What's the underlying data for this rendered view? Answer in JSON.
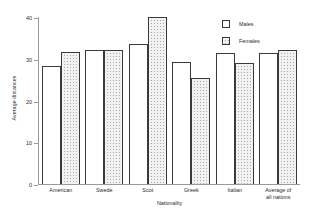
{
  "chart_data": {
    "type": "bar",
    "title": "",
    "xlabel": "Nationality",
    "ylabel": "Average distances",
    "ylim": [
      0,
      40
    ],
    "yticks": [
      0,
      10,
      20,
      30,
      40
    ],
    "grid": false,
    "legend_position": "top-right",
    "categories": [
      "American",
      "Swede",
      "Scot",
      "Greek",
      "Italian",
      "Average of\nall nations"
    ],
    "series": [
      {
        "name": "Males",
        "values": [
          28.2,
          32.2,
          33.6,
          29.2,
          31.5,
          31.3
        ]
      },
      {
        "name": "Females",
        "values": [
          31.6,
          32.2,
          40.0,
          25.4,
          29.0,
          32.0
        ]
      }
    ]
  }
}
